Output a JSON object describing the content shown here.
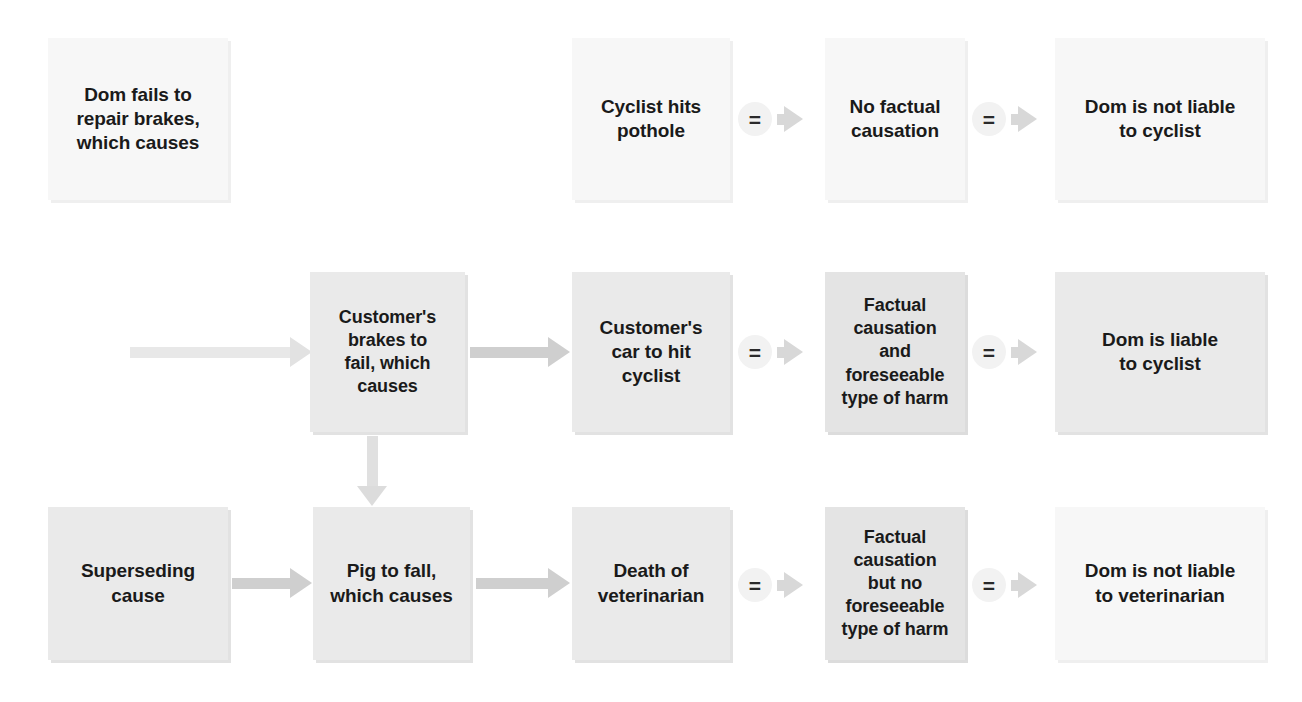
{
  "diagram": {
    "colors": {
      "pale_fill": "#f7f7f7",
      "grey_fill": "#eaeaea",
      "grey2_fill": "#e4e4e4",
      "arrow": "#cfcfcf",
      "text": "#1a1a1a"
    },
    "nodes": {
      "dom_fails": "Dom fails to\nrepair brakes,\nwhich causes",
      "superseding_cause": "Superseding\ncause",
      "customers_brakes": "Customer's\nbrakes to\nfail, which\ncauses",
      "pig_to_fall": "Pig to fall,\nwhich causes",
      "cyclist_hits_pothole": "Cyclist hits\npothole",
      "customers_car": "Customer's\ncar to hit\ncyclist",
      "death_of_vet": "Death of\nveterinarian",
      "no_factual_causation": "No factual\ncausation",
      "factual_and_foreseeable": "Factual\ncausation\nand\nforeseeable\ntype of harm",
      "factual_no_foreseeable": "Factual\ncausation\nbut no\nforeseeable\ntype of harm",
      "not_liable_cyclist": "Dom is not liable\nto cyclist",
      "liable_cyclist": "Dom is liable\nto cyclist",
      "not_liable_vet": "Dom is not liable\nto veterinarian"
    },
    "connectors": {
      "equals_symbol": "=",
      "equals_1_label": "=",
      "equals_2_label": "=",
      "equals_3_label": "=",
      "equals_4_label": "=",
      "equals_5_label": "=",
      "equals_6_label": "="
    }
  }
}
